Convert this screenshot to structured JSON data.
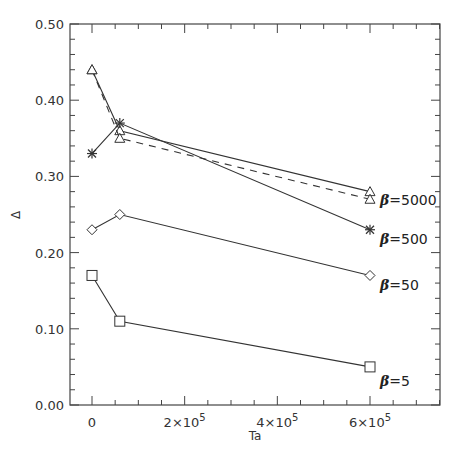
{
  "chart_data": {
    "type": "line",
    "title": "",
    "xlabel": "Ta",
    "ylabel": "Δ",
    "xlim": [
      -50000,
      750000
    ],
    "ylim": [
      0.0,
      0.5
    ],
    "x_ticks": [
      {
        "value": 0,
        "label": "0"
      },
      {
        "value": 200000,
        "label": "2×10",
        "exp": "5"
      },
      {
        "value": 400000,
        "label": "4×10",
        "exp": "5"
      },
      {
        "value": 600000,
        "label": "6×10",
        "exp": "5"
      }
    ],
    "x_minor_step": 50000,
    "y_ticks": [
      {
        "value": 0.0,
        "label": "0.00"
      },
      {
        "value": 0.1,
        "label": "0.10"
      },
      {
        "value": 0.2,
        "label": "0.20"
      },
      {
        "value": 0.3,
        "label": "0.30"
      },
      {
        "value": 0.4,
        "label": "0.40"
      },
      {
        "value": 0.5,
        "label": "0.50"
      }
    ],
    "y_minor_step": 0.02,
    "grid": false,
    "legend": "inline labels at right end of series",
    "x": [
      0,
      60000,
      600000
    ],
    "series": [
      {
        "name": "β=5000 (solid)",
        "marker": "triangle",
        "line": "solid",
        "values": [
          0.44,
          0.36,
          0.28
        ]
      },
      {
        "name": "β=5000 (dashed)",
        "marker": "triangle",
        "line": "dashed",
        "values": [
          0.44,
          0.35,
          0.27
        ]
      },
      {
        "name": "β=500",
        "marker": "asterisk",
        "line": "solid",
        "values": [
          0.33,
          0.37,
          0.23
        ]
      },
      {
        "name": "β=50",
        "marker": "diamond",
        "line": "solid",
        "values": [
          0.23,
          0.25,
          0.17
        ]
      },
      {
        "name": "β=5",
        "marker": "square",
        "line": "solid",
        "values": [
          0.17,
          0.11,
          0.05
        ]
      }
    ],
    "annotations": [
      {
        "symbol": "β",
        "text": "=5000",
        "near_series": 0,
        "x_px": 380,
        "y_px": 205
      },
      {
        "symbol": "β",
        "text": "=500",
        "near_series": 2,
        "x_px": 380,
        "y_px": 244
      },
      {
        "symbol": "β",
        "text": "=50",
        "near_series": 3,
        "x_px": 380,
        "y_px": 290
      },
      {
        "symbol": "β",
        "text": "=5",
        "near_series": 4,
        "x_px": 380,
        "y_px": 386
      }
    ]
  },
  "layout": {
    "plot_left": 70,
    "plot_right": 440,
    "plot_top": 24,
    "plot_bottom": 405,
    "x0_px": 92,
    "x600k_px": 370,
    "line_color": "#333333",
    "axis_color": "#444444"
  }
}
